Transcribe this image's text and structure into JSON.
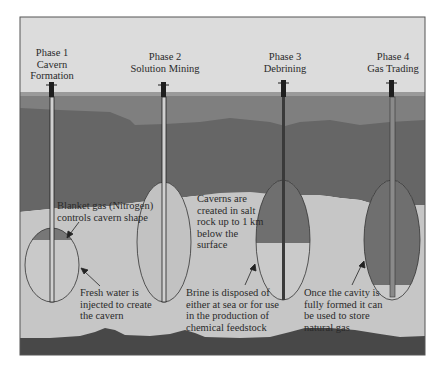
{
  "figure": {
    "colors": {
      "sky": "#dcdcdc",
      "surface_line": "#9a9a9a",
      "topsoil": "#7f7f7f",
      "rock": "#666666",
      "salt": "#c6c6c6",
      "basement": "#484848",
      "cavity_gas": "#777777",
      "cavity_liquid": "#c9c9c9",
      "well": "#222222",
      "frame": "#555555"
    }
  },
  "phases": [
    {
      "id": "phase-1",
      "title_line1": "Phase 1",
      "title_line2": "Cavern",
      "title_line3": "Formation"
    },
    {
      "id": "phase-2",
      "title_line1": "Phase 2",
      "title_line2": "Solution Mining"
    },
    {
      "id": "phase-3",
      "title_line1": "Phase 3",
      "title_line2": "Debrining"
    },
    {
      "id": "phase-4",
      "title_line1": "Phase 4",
      "title_line2": "Gas Trading"
    }
  ],
  "annotations": {
    "blanket_gas": "Blanket gas (Nitrogen)\ncontrols cavern shape",
    "fresh_water": "Fresh water is\ninjected to create\nthe cavern",
    "caverns_created": "Caverns are\ncreated in salt\nrock up to 1 km\nbelow the\nsurface",
    "brine": "Brine is disposed of\neither at sea or for use\nin the production of\nchemical feedstock",
    "once_formed": "Once the cavity is\nfully formed it can\nbe used to store\nnatural gas"
  }
}
